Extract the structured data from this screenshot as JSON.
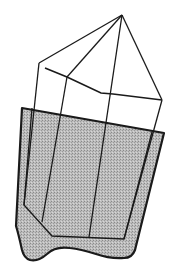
{
  "diagram": {
    "colors": {
      "background": "#ffffff",
      "stroke": "#1a1a1a",
      "shade_fill": "#b8b8b8",
      "shade_dot": "#8e8e8e"
    },
    "apex": [
      122,
      15
    ],
    "upper_wireframe": {
      "outer_left_vertex": [
        39,
        63
      ],
      "inner_left_start": [
        45,
        68
      ],
      "inner_left_join": [
        67,
        77
      ],
      "kink": [
        101,
        93
      ],
      "center_cross": [
        113,
        94
      ],
      "right_vertex": [
        162,
        100
      ]
    },
    "shaded_body": {
      "top_left": [
        22,
        108
      ],
      "top_right": [
        164,
        133
      ],
      "bottom_right": [
        130,
        257
      ],
      "bottom_left": [
        24,
        259
      ]
    }
  }
}
